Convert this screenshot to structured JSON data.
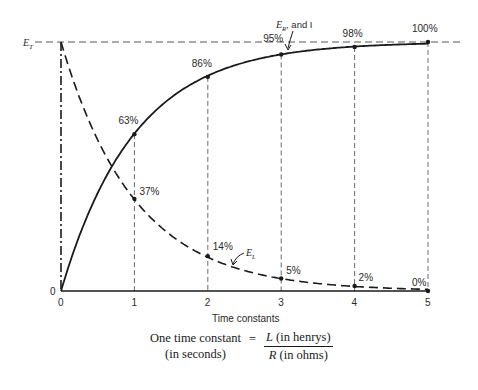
{
  "chart_data": {
    "type": "line",
    "title": "",
    "xlabel": "Time constants",
    "ylabel": "",
    "x": [
      0,
      1,
      2,
      3,
      4,
      5
    ],
    "xlim": [
      0,
      5
    ],
    "ylim": [
      0,
      100
    ],
    "grid": "vertical dashed lines at each time constant",
    "series": [
      {
        "name": "E_R, and I",
        "style": "solid",
        "values": [
          0,
          63,
          86,
          95,
          98,
          100
        ],
        "point_labels": [
          "",
          "63%",
          "86%",
          "95%",
          "98%",
          "100%"
        ]
      },
      {
        "name": "E_L",
        "style": "dashed",
        "values": [
          100,
          37,
          14,
          5,
          2,
          0
        ],
        "point_labels": [
          "",
          "37%",
          "14%",
          "5%",
          "2%",
          "0%"
        ]
      }
    ],
    "y_axis_labels": {
      "top": "E_T",
      "bottom": "0"
    },
    "reference_line": {
      "label": "E_T",
      "value": 100,
      "style": "dashed horizontal"
    },
    "annotations": [
      "E_R, and I",
      "E_L"
    ]
  },
  "labels": {
    "y_top_main": "E",
    "y_top_sub": "T",
    "y_zero": "0",
    "x_ticks": [
      "0",
      "1",
      "2",
      "3",
      "4",
      "5"
    ],
    "x_axis_title": "Time constants",
    "er_main": "E",
    "er_sub": "R",
    "er_rest": ", and I",
    "el_main": "E",
    "el_sub": "L"
  },
  "formula": {
    "lhs_line1": "One time constant",
    "lhs_line2": "(in seconds)",
    "equals": "=",
    "num_var": "L",
    "num_text": " (in henrys)",
    "den_var": "R",
    "den_text": " (in ohms)"
  },
  "colors": {
    "ink": "#1a1a1a",
    "background": "#ffffff"
  }
}
